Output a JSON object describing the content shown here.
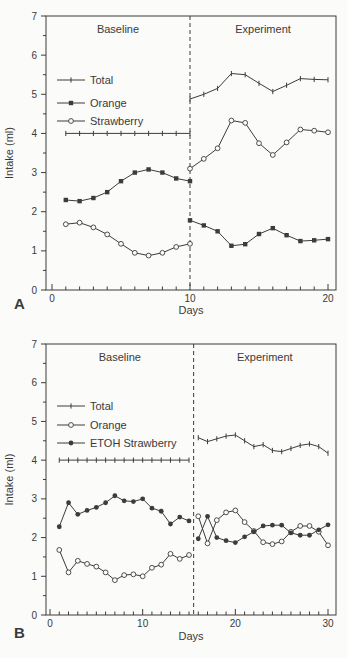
{
  "figure": {
    "background": "#fbfbf9",
    "ink": "#3c3c3c"
  },
  "chart_data": [
    {
      "type": "line",
      "panel_label": "A",
      "xlabel": "Days",
      "ylabel": "Intake (ml)",
      "xlim": [
        0,
        21
      ],
      "ylim": [
        0,
        7
      ],
      "x_major_ticks": [
        0,
        10,
        20
      ],
      "x_minor_step": 1,
      "y_major_ticks": [
        0,
        1,
        2,
        3,
        4,
        5,
        6,
        7
      ],
      "y_minor_step": 0.5,
      "divider_day": 10,
      "phase_labels": {
        "baseline": "Baseline",
        "experiment": "Experiment"
      },
      "legend": [
        {
          "label": "Total",
          "marker": "tick"
        },
        {
          "label": "Orange",
          "marker": "square-filled"
        },
        {
          "label": "Strawberry",
          "marker": "circle-open"
        }
      ],
      "series": [
        {
          "name": "Total",
          "marker": "tick",
          "segments": [
            {
              "x": [
                1,
                2,
                3,
                4,
                5,
                6,
                7,
                8,
                9,
                10
              ],
              "y": [
                4.0,
                4.0,
                4.0,
                4.0,
                4.0,
                4.0,
                4.0,
                4.0,
                4.0,
                4.0
              ]
            },
            {
              "x": [
                10,
                11,
                12,
                13,
                14,
                15,
                16,
                17,
                18,
                19,
                20
              ],
              "y": [
                4.88,
                5.0,
                5.15,
                5.53,
                5.5,
                5.28,
                5.07,
                5.23,
                5.4,
                5.38,
                5.37
              ]
            }
          ]
        },
        {
          "name": "Orange",
          "marker": "square-filled",
          "segments": [
            {
              "x": [
                1,
                2,
                3,
                4,
                5,
                6,
                7,
                8,
                9,
                10
              ],
              "y": [
                2.3,
                2.27,
                2.35,
                2.5,
                2.78,
                3.0,
                3.08,
                3.0,
                2.85,
                2.78
              ]
            },
            {
              "x": [
                10,
                11,
                12,
                13,
                14,
                15,
                16,
                17,
                18,
                19,
                20
              ],
              "y": [
                1.78,
                1.65,
                1.5,
                1.13,
                1.17,
                1.43,
                1.58,
                1.4,
                1.25,
                1.27,
                1.3
              ]
            }
          ]
        },
        {
          "name": "Strawberry",
          "marker": "circle-open",
          "segments": [
            {
              "x": [
                1,
                2,
                3,
                4,
                5,
                6,
                7,
                8,
                9,
                10
              ],
              "y": [
                1.68,
                1.72,
                1.6,
                1.42,
                1.18,
                0.95,
                0.88,
                0.95,
                1.1,
                1.18
              ]
            },
            {
              "x": [
                10,
                11,
                12,
                13,
                14,
                15,
                16,
                17,
                18,
                19,
                20
              ],
              "y": [
                3.1,
                3.35,
                3.62,
                4.33,
                4.27,
                3.75,
                3.45,
                3.77,
                4.1,
                4.07,
                4.03
              ]
            }
          ]
        }
      ]
    },
    {
      "type": "line",
      "panel_label": "B",
      "xlabel": "Days",
      "ylabel": "Intake (ml)",
      "xlim": [
        0,
        31
      ],
      "ylim": [
        0,
        7
      ],
      "x_major_ticks": [
        0,
        10,
        20,
        30
      ],
      "x_minor_step": 1,
      "y_major_ticks": [
        0,
        1,
        2,
        3,
        4,
        5,
        6,
        7
      ],
      "y_minor_step": 0.5,
      "divider_day": 15.5,
      "phase_labels": {
        "baseline": "Baseline",
        "experiment": "Experiment"
      },
      "legend": [
        {
          "label": "Total",
          "marker": "tick"
        },
        {
          "label": "Orange",
          "marker": "circle-open"
        },
        {
          "label": "ETOH Strawberry",
          "marker": "circle-filled"
        }
      ],
      "series": [
        {
          "name": "Total",
          "marker": "tick",
          "segments": [
            {
              "x": [
                1,
                2,
                3,
                4,
                5,
                6,
                7,
                8,
                9,
                10,
                11,
                12,
                13,
                14,
                15
              ],
              "y": [
                4.0,
                4.0,
                4.0,
                4.0,
                4.0,
                4.0,
                4.0,
                4.0,
                4.0,
                4.0,
                4.0,
                4.0,
                4.0,
                4.0,
                4.0
              ]
            },
            {
              "x": [
                16,
                17,
                18,
                19,
                20,
                21,
                22,
                23,
                24,
                25,
                26,
                27,
                28,
                29,
                30
              ],
              "y": [
                4.58,
                4.48,
                4.55,
                4.62,
                4.65,
                4.5,
                4.35,
                4.4,
                4.25,
                4.22,
                4.3,
                4.38,
                4.42,
                4.35,
                4.18
              ]
            }
          ]
        },
        {
          "name": "Orange",
          "marker": "circle-open",
          "segments": [
            {
              "x": [
                1,
                2,
                3,
                4,
                5,
                6,
                7,
                8,
                9,
                10,
                11,
                12,
                13,
                14,
                15
              ],
              "y": [
                1.68,
                1.1,
                1.4,
                1.32,
                1.25,
                1.1,
                0.9,
                1.03,
                1.05,
                1.0,
                1.22,
                1.3,
                1.58,
                1.45,
                1.55
              ]
            },
            {
              "x": [
                16,
                17,
                18,
                19,
                20,
                21,
                22,
                23,
                24,
                25,
                26,
                27,
                28,
                29,
                30
              ],
              "y": [
                2.55,
                1.85,
                2.45,
                2.65,
                2.7,
                2.4,
                2.17,
                1.88,
                1.83,
                1.9,
                2.15,
                2.3,
                2.3,
                2.15,
                1.8
              ]
            }
          ]
        },
        {
          "name": "ETOH Strawberry",
          "marker": "circle-filled",
          "segments": [
            {
              "x": [
                1,
                2,
                3,
                4,
                5,
                6,
                7,
                8,
                9,
                10,
                11,
                12,
                13,
                14,
                15
              ],
              "y": [
                2.28,
                2.9,
                2.6,
                2.7,
                2.78,
                2.9,
                3.08,
                2.95,
                2.93,
                3.0,
                2.76,
                2.68,
                2.35,
                2.53,
                2.43
              ]
            },
            {
              "x": [
                16,
                17,
                18,
                19,
                20,
                21,
                22,
                23,
                24,
                25,
                26,
                27,
                28,
                29,
                30
              ],
              "y": [
                1.97,
                2.55,
                2.0,
                1.92,
                1.87,
                2.02,
                2.15,
                2.3,
                2.32,
                2.32,
                2.12,
                2.06,
                2.06,
                2.2,
                2.33
              ]
            }
          ]
        }
      ]
    }
  ]
}
